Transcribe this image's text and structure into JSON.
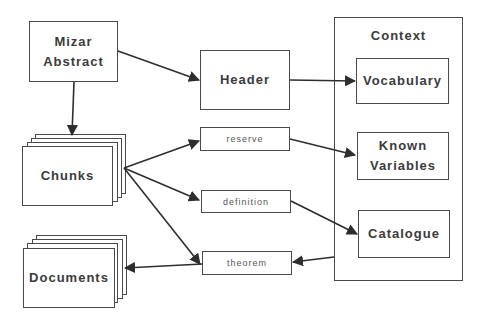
{
  "diagram": {
    "type": "flow-diagram",
    "nodes": {
      "mizar_abstract": {
        "line1": "Mizar",
        "line2": "Abstract"
      },
      "header": {
        "label": "Header"
      },
      "chunks": {
        "label": "Chunks"
      },
      "documents": {
        "label": "Documents"
      },
      "reserve": {
        "label": "reserve"
      },
      "definition": {
        "label": "definition"
      },
      "theorem": {
        "label": "theorem"
      },
      "context": {
        "title": "Context",
        "vocabulary": {
          "label": "Vocabulary"
        },
        "known_variables": {
          "line1": "Known",
          "line2": "Variables"
        },
        "catalogue": {
          "label": "Catalogue"
        }
      }
    },
    "edges": [
      {
        "from": "Mizar Abstract",
        "to": "Header"
      },
      {
        "from": "Mizar Abstract",
        "to": "Chunks"
      },
      {
        "from": "Header",
        "to": "Vocabulary"
      },
      {
        "from": "Chunks",
        "to": "reserve"
      },
      {
        "from": "Chunks",
        "to": "definition"
      },
      {
        "from": "Chunks",
        "to": "theorem"
      },
      {
        "from": "reserve",
        "to": "Known Variables"
      },
      {
        "from": "definition",
        "to": "Catalogue"
      },
      {
        "from": "Context",
        "to": "theorem"
      },
      {
        "from": "theorem",
        "to": "Documents"
      }
    ],
    "colors": {
      "stroke": "#3a3a3a",
      "background": "#ffffff",
      "text": "#3b3b3b"
    }
  }
}
